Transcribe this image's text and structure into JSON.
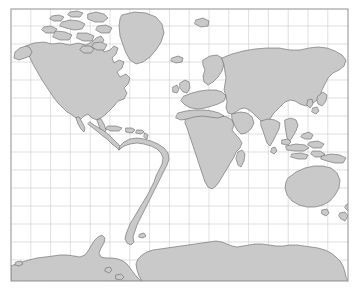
{
  "map": {
    "title": "World Map",
    "projection": "mercator",
    "frame": {
      "x": 11,
      "y": 9,
      "width": 337,
      "height": 272
    },
    "background_color": "#ffffff",
    "land_fill_color": "#c9c9c9",
    "land_stroke_color": "#6e6e6e",
    "graticule_color": "#d2d2d2",
    "frame_color": "#9a9a9a",
    "graticule": {
      "meridian_step_px": 19.8,
      "meridian_count": 17,
      "parallels_y": [
        9,
        26,
        44,
        62,
        80,
        98,
        116,
        134,
        152,
        170,
        188,
        206,
        224,
        242,
        260,
        281
      ]
    },
    "regions": [
      {
        "name": "North America"
      },
      {
        "name": "Greenland"
      },
      {
        "name": "Canadian Arctic Archipelago"
      },
      {
        "name": "Iceland"
      },
      {
        "name": "Svalbard"
      },
      {
        "name": "Central America"
      },
      {
        "name": "Caribbean"
      },
      {
        "name": "South America"
      },
      {
        "name": "Europe"
      },
      {
        "name": "Scandinavia"
      },
      {
        "name": "British Isles"
      },
      {
        "name": "Africa"
      },
      {
        "name": "Madagascar"
      },
      {
        "name": "Asia"
      },
      {
        "name": "Siberia"
      },
      {
        "name": "Arabian Peninsula"
      },
      {
        "name": "India"
      },
      {
        "name": "Sri Lanka"
      },
      {
        "name": "Japan"
      },
      {
        "name": "Southeast Asia"
      },
      {
        "name": "Indonesia"
      },
      {
        "name": "New Guinea"
      },
      {
        "name": "Australia"
      },
      {
        "name": "New Zealand"
      },
      {
        "name": "Antarctica"
      }
    ]
  }
}
